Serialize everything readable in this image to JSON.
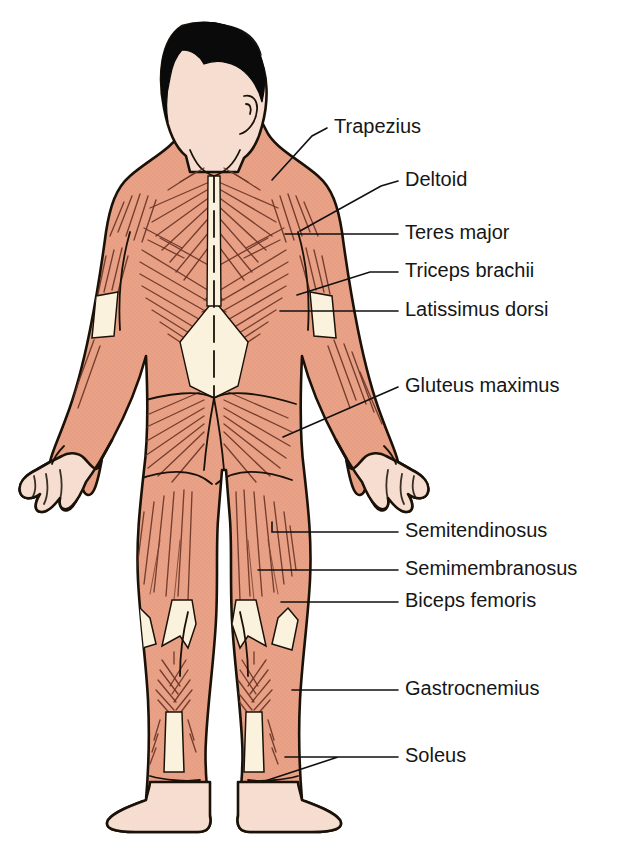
{
  "diagram": {
    "background_color": "#ffffff",
    "view": "posterior"
  },
  "palette": {
    "muscle_fill": "#e9a187",
    "muscle_fill_light": "#eeb19a",
    "muscle_fiber_stroke": "#6b3526",
    "skin_fill": "#f6ded1",
    "skin_shadow": "#edc9b6",
    "fascia_fill": "#fbf2de",
    "hair_fill": "#0a0a0a",
    "outline_stroke": "#1a1208",
    "label_text": "#161616",
    "leader_line": "#111111"
  },
  "labels": [
    {
      "id": "trapezius",
      "text": "Trapezius",
      "text_x": 334,
      "text_y": 128,
      "leader": "M 327 128 L 312 136 L 272 180"
    },
    {
      "id": "deltoid",
      "text": "Deltoid",
      "text_x": 405,
      "text_y": 181,
      "leader": "M 398 181 L 381 186 L 300 231"
    },
    {
      "id": "teres-major",
      "text": "Teres major",
      "text_x": 405,
      "text_y": 234,
      "leader": "M 398 234 L 285 234"
    },
    {
      "id": "triceps-brachii",
      "text": "Triceps brachii",
      "text_x": 405,
      "text_y": 272,
      "leader": "M 398 272 L 370 272 L 297 295"
    },
    {
      "id": "latissimus-dorsi",
      "text": "Latissimus dorsi",
      "text_x": 405,
      "text_y": 311,
      "leader": "M 398 311 L 280 311"
    },
    {
      "id": "gluteus-maximus",
      "text": "Gluteus maximus",
      "text_x": 405,
      "text_y": 387,
      "leader": "M 398 387 L 283 437"
    },
    {
      "id": "semitendinosus",
      "text": "Semitendinosus",
      "text_x": 405,
      "text_y": 532,
      "leader": "M 398 532 L 272 532 L 272 522"
    },
    {
      "id": "semimembranosus",
      "text": "Semimembranosus",
      "text_x": 405,
      "text_y": 570,
      "leader": "M 398 570 L 258 570"
    },
    {
      "id": "biceps-femoris",
      "text": "Biceps femoris",
      "text_x": 405,
      "text_y": 602,
      "leader": "M 398 602 L 281 602"
    },
    {
      "id": "gastrocnemius",
      "text": "Gastrocnemius",
      "text_x": 405,
      "text_y": 690,
      "leader": "M 398 690 L 292 690"
    },
    {
      "id": "soleus",
      "text": "Soleus",
      "text_x": 405,
      "text_y": 757,
      "leader": "M 398 757 L 285 757 M 338 757 L 262 782"
    }
  ],
  "label_count": 11,
  "muscle_groups": {
    "upper_body": [
      "Trapezius",
      "Deltoid",
      "Teres major",
      "Triceps brachii",
      "Latissimus dorsi"
    ],
    "hip": [
      "Gluteus maximus"
    ],
    "hamstrings": [
      "Semitendinosus",
      "Semimembranosus",
      "Biceps femoris"
    ],
    "lower_leg": [
      "Gastrocnemius",
      "Soleus"
    ]
  },
  "font": {
    "label_size_px": 20
  }
}
